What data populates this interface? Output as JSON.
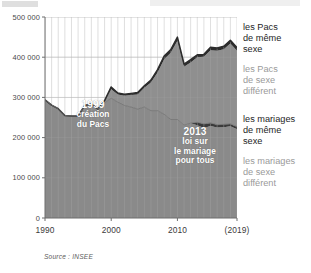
{
  "source_note": "Source : INSEE",
  "legend": {
    "items": [
      {
        "label_lines": [
          "les Pacs",
          "de même",
          "sexe"
        ],
        "tone": "dark",
        "color": "#1e1e1e"
      },
      {
        "label_lines": [
          "les Pacs",
          "de sexe",
          "différent"
        ],
        "tone": "mid",
        "color": "#9a9a9a"
      },
      {
        "label_lines": [
          "les mariages",
          "de même",
          "sexe"
        ],
        "tone": "dark",
        "color": "#1e1e1e"
      },
      {
        "label_lines": [
          "les mariages",
          "de sexe",
          "différent"
        ],
        "tone": "mid",
        "color": "#9a9a9a"
      }
    ]
  },
  "annotations": [
    {
      "id": "annot-1999",
      "headline": "1999",
      "lines": [
        "création",
        "du Pacs"
      ]
    },
    {
      "id": "annot-2013",
      "headline": "2013",
      "lines": [
        "loi sur",
        "le mariage",
        "pour tous"
      ]
    }
  ],
  "colors": {
    "area_upper": "#8f8f8f",
    "area_lower": "#8a8a8a",
    "area_darkband": "#3a3a3a",
    "line_dark": "#2c2c2c",
    "gridline": "#c9c9c9",
    "gridline_in_fill": "#a2a2a2",
    "axis": "#6d6d6d",
    "plot_background": "#ffffff",
    "tick_text": "#4a4a4a"
  },
  "chart_data": {
    "type": "area",
    "title": "",
    "subtitle": "",
    "xlabel": "",
    "ylabel": "",
    "xlim": [
      1990,
      2019
    ],
    "ylim": [
      0,
      500000
    ],
    "grid": true,
    "legend_position": "right",
    "x_tick_labels": [
      "1990",
      "2000",
      "2010",
      "(2019)"
    ],
    "x_tick_values": [
      1990,
      2000,
      2010,
      2019
    ],
    "y_tick_labels": [
      "0",
      "100 000",
      "200 000",
      "300 000",
      "400 000",
      "500 000"
    ],
    "y_tick_values": [
      0,
      100000,
      200000,
      300000,
      400000,
      500000
    ],
    "stacked": true,
    "x": [
      1990,
      1991,
      1992,
      1993,
      1994,
      1995,
      1996,
      1997,
      1998,
      1999,
      2000,
      2001,
      2002,
      2003,
      2004,
      2005,
      2006,
      2007,
      2008,
      2009,
      2010,
      2011,
      2012,
      2013,
      2014,
      2015,
      2016,
      2017,
      2018,
      2019
    ],
    "series": [
      {
        "name": "les mariages de sexe différent",
        "color": "#8a8a8a",
        "values": [
          294000,
          281000,
          272000,
          255000,
          254000,
          254000,
          280000,
          284000,
          271000,
          286000,
          298000,
          288000,
          280000,
          276000,
          271000,
          276000,
          267000,
          267000,
          258000,
          245000,
          245000,
          231000,
          236000,
          231000,
          224000,
          229000,
          225000,
          226000,
          228000,
          221000
        ]
      },
      {
        "name": "les mariages de même sexe",
        "color": "#3a3a3a",
        "values": [
          0,
          0,
          0,
          0,
          0,
          0,
          0,
          0,
          0,
          0,
          0,
          0,
          0,
          0,
          0,
          0,
          0,
          0,
          0,
          0,
          0,
          0,
          0,
          7000,
          10000,
          7500,
          7000,
          7000,
          6000,
          6000
        ]
      },
      {
        "name": "les Pacs de sexe différent",
        "color": "#8f8f8f",
        "values": [
          0,
          0,
          0,
          0,
          0,
          0,
          0,
          0,
          0,
          6000,
          22000,
          19000,
          24000,
          30000,
          36000,
          48000,
          70000,
          95000,
          137000,
          166000,
          196000,
          145000,
          151000,
          162000,
          167000,
          181000,
          184000,
          187000,
          200000,
          189000
        ]
      },
      {
        "name": "les Pacs de même sexe",
        "color": "#2c2c2c",
        "values": [
          0,
          0,
          0,
          0,
          0,
          0,
          0,
          0,
          0,
          0,
          6000,
          4000,
          4000,
          4000,
          5000,
          5000,
          6000,
          7000,
          8000,
          8000,
          9000,
          7000,
          7000,
          6000,
          6000,
          7000,
          7000,
          7000,
          8000,
          8000
        ]
      }
    ],
    "total_top_line": [
      294000,
      281000,
      272000,
      255000,
      254000,
      254000,
      280000,
      284000,
      271000,
      292000,
      326000,
      311000,
      308000,
      310000,
      312000,
      329000,
      343000,
      369000,
      403000,
      419000,
      450000,
      383000,
      394000,
      406000,
      407000,
      424000,
      423000,
      427000,
      442000,
      424000
    ],
    "annotation_points": [
      {
        "year": 1999,
        "label": "1999 création du Pacs"
      },
      {
        "year": 2013,
        "label": "2013 loi sur le mariage pour tous"
      }
    ]
  }
}
